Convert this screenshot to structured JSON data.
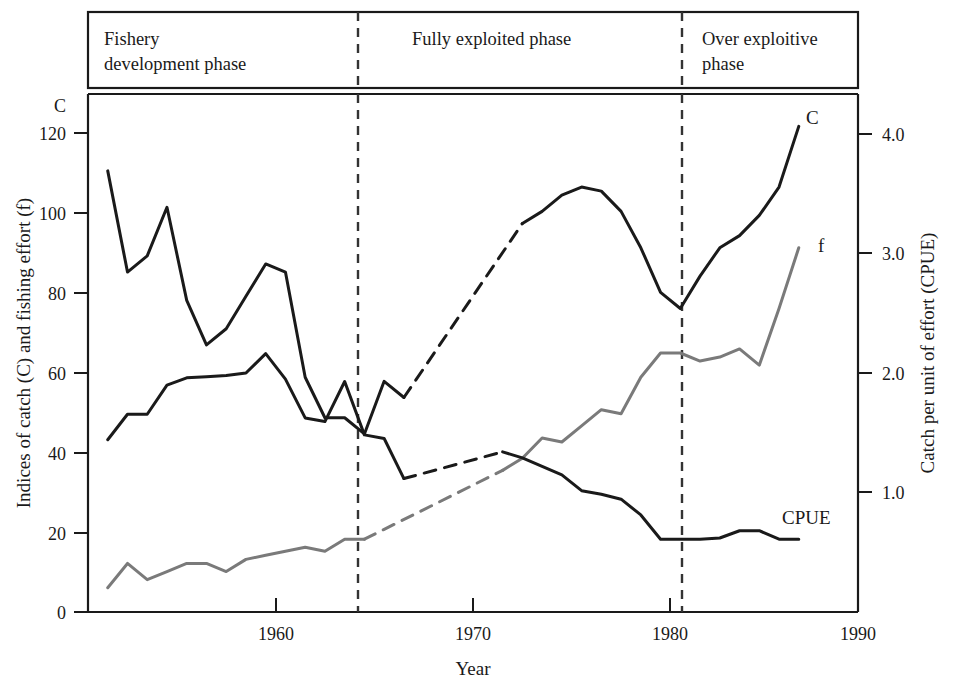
{
  "figure": {
    "background_color": "#ffffff",
    "ink_color": "#1a1a1a"
  },
  "phases": [
    {
      "id": "phase-development",
      "label": "Fishery\ndevelopment phase",
      "line1": "Fishery",
      "line2": "development phase",
      "start_year": 1952,
      "end_year": 1964
    },
    {
      "id": "phase-fully-exploited",
      "label": "Fully exploited phase",
      "line1": "Fully exploited phase",
      "line2": "",
      "start_year": 1964,
      "end_year": 1980
    },
    {
      "id": "phase-over-exploitive",
      "label": "Over exploitive phase",
      "line1": "Over exploitive",
      "line2": "phase",
      "start_year": 1980,
      "end_year": 1990
    }
  ],
  "axes": {
    "x": {
      "label": "Year",
      "min": 1951,
      "max": 1990,
      "ticks": [
        1960,
        1970,
        1980,
        1990
      ],
      "tick_labels": [
        "1960",
        "1970",
        "1980",
        "1990"
      ]
    },
    "y_left": {
      "label": "Indices of catch (C) and fishing effort (f)",
      "corner_label": "C",
      "min": 0,
      "max": 128,
      "ticks": [
        0,
        20,
        40,
        60,
        80,
        100,
        120
      ],
      "tick_labels": [
        "0",
        "20",
        "40",
        "60",
        "80",
        "100",
        "120"
      ]
    },
    "y_right": {
      "label": "Catch per unit of effort (CPUE)",
      "min": 0,
      "max": 4.27,
      "ticks": [
        1.0,
        2.0,
        3.0,
        4.0
      ],
      "tick_labels": [
        "1.0",
        "2.0",
        "3.0",
        "4.0"
      ]
    }
  },
  "series_labels": {
    "catch": "C",
    "effort": "f",
    "cpue": "CPUE"
  },
  "chart_data": {
    "type": "line",
    "title": "",
    "xlabel": "Year",
    "ylabel": "Indices of catch (C) and fishing effort (f)",
    "y2label": "Catch per unit of effort (CPUE)",
    "xlim": [
      1951,
      1990
    ],
    "ylim": [
      0,
      128
    ],
    "y2lim": [
      0,
      4.27
    ],
    "grid": false,
    "legend": "inline-end-of-line",
    "annotations": [
      {
        "text": "Fishery development phase",
        "x_range": [
          1951,
          1964
        ]
      },
      {
        "text": "Fully exploited phase",
        "x_range": [
          1964,
          1980
        ]
      },
      {
        "text": "Over exploitive phase",
        "x_range": [
          1980,
          1990
        ]
      }
    ],
    "vertical_dividers": [
      1964,
      1980
    ],
    "series": [
      {
        "name": "C",
        "axis": "left",
        "color": "#1a1a1a",
        "width": 3.0,
        "solid": [
          [
            1952,
            109
          ],
          [
            1953,
            84
          ],
          [
            1954,
            88
          ],
          [
            1955,
            100
          ],
          [
            1956,
            77
          ],
          [
            1957,
            66
          ],
          [
            1958,
            70
          ],
          [
            1959,
            78
          ],
          [
            1960,
            86
          ],
          [
            1961,
            84
          ],
          [
            1962,
            58
          ],
          [
            1963,
            48
          ],
          [
            1964,
            48
          ],
          [
            1965,
            44
          ],
          [
            1966,
            57
          ],
          [
            1967,
            53
          ]
        ],
        "dashed": [
          [
            1967,
            53
          ],
          [
            1973,
            96
          ]
        ],
        "solid2": [
          [
            1973,
            96
          ],
          [
            1974,
            99
          ],
          [
            1975,
            103
          ],
          [
            1976,
            105
          ],
          [
            1977,
            104
          ],
          [
            1978,
            99
          ],
          [
            1979,
            90
          ],
          [
            1980,
            79
          ],
          [
            1981,
            75
          ],
          [
            1982,
            83
          ],
          [
            1983,
            90
          ],
          [
            1984,
            93
          ],
          [
            1985,
            98
          ],
          [
            1986,
            105
          ],
          [
            1987,
            120
          ]
        ]
      },
      {
        "name": "f",
        "axis": "left",
        "color": "#7a7a7a",
        "width": 3.0,
        "solid": [
          [
            1952,
            6
          ],
          [
            1953,
            12
          ],
          [
            1954,
            8
          ],
          [
            1955,
            10
          ],
          [
            1956,
            12
          ],
          [
            1957,
            12
          ],
          [
            1958,
            10
          ],
          [
            1959,
            13
          ],
          [
            1960,
            14
          ],
          [
            1961,
            15
          ],
          [
            1962,
            16
          ],
          [
            1963,
            15
          ],
          [
            1964,
            18
          ],
          [
            1965,
            18
          ]
        ],
        "dashed": [
          [
            1965,
            18
          ],
          [
            1972,
            35
          ]
        ],
        "solid2": [
          [
            1972,
            35
          ],
          [
            1973,
            38
          ],
          [
            1974,
            43
          ],
          [
            1975,
            42
          ],
          [
            1976,
            46
          ],
          [
            1977,
            50
          ],
          [
            1978,
            49
          ],
          [
            1979,
            58
          ],
          [
            1980,
            64
          ],
          [
            1981,
            64
          ],
          [
            1982,
            62
          ],
          [
            1983,
            63
          ],
          [
            1984,
            65
          ],
          [
            1985,
            61
          ],
          [
            1986,
            75
          ],
          [
            1987,
            90
          ]
        ]
      },
      {
        "name": "CPUE",
        "axis": "right",
        "color": "#1a1a1a",
        "width": 3.0,
        "solid": [
          [
            1952,
            1.42
          ],
          [
            1953,
            1.63
          ],
          [
            1954,
            1.63
          ],
          [
            1955,
            1.87
          ],
          [
            1956,
            1.93
          ],
          [
            1957,
            1.94
          ],
          [
            1958,
            1.95
          ],
          [
            1959,
            1.97
          ],
          [
            1960,
            2.13
          ],
          [
            1961,
            1.92
          ],
          [
            1962,
            1.6
          ],
          [
            1963,
            1.57
          ],
          [
            1964,
            1.9
          ],
          [
            1965,
            1.46
          ],
          [
            1966,
            1.43
          ],
          [
            1967,
            1.1
          ]
        ],
        "dashed": [
          [
            1967,
            1.1
          ],
          [
            1972,
            1.32
          ]
        ],
        "solid2": [
          [
            1972,
            1.32
          ],
          [
            1973,
            1.27
          ],
          [
            1974,
            1.2
          ],
          [
            1975,
            1.13
          ],
          [
            1976,
            1.0
          ],
          [
            1977,
            0.97
          ],
          [
            1978,
            0.93
          ],
          [
            1979,
            0.8
          ],
          [
            1980,
            0.6
          ],
          [
            1981,
            0.6
          ],
          [
            1982,
            0.6
          ],
          [
            1983,
            0.61
          ],
          [
            1984,
            0.67
          ],
          [
            1985,
            0.67
          ],
          [
            1986,
            0.6
          ],
          [
            1987,
            0.6
          ]
        ]
      }
    ]
  }
}
